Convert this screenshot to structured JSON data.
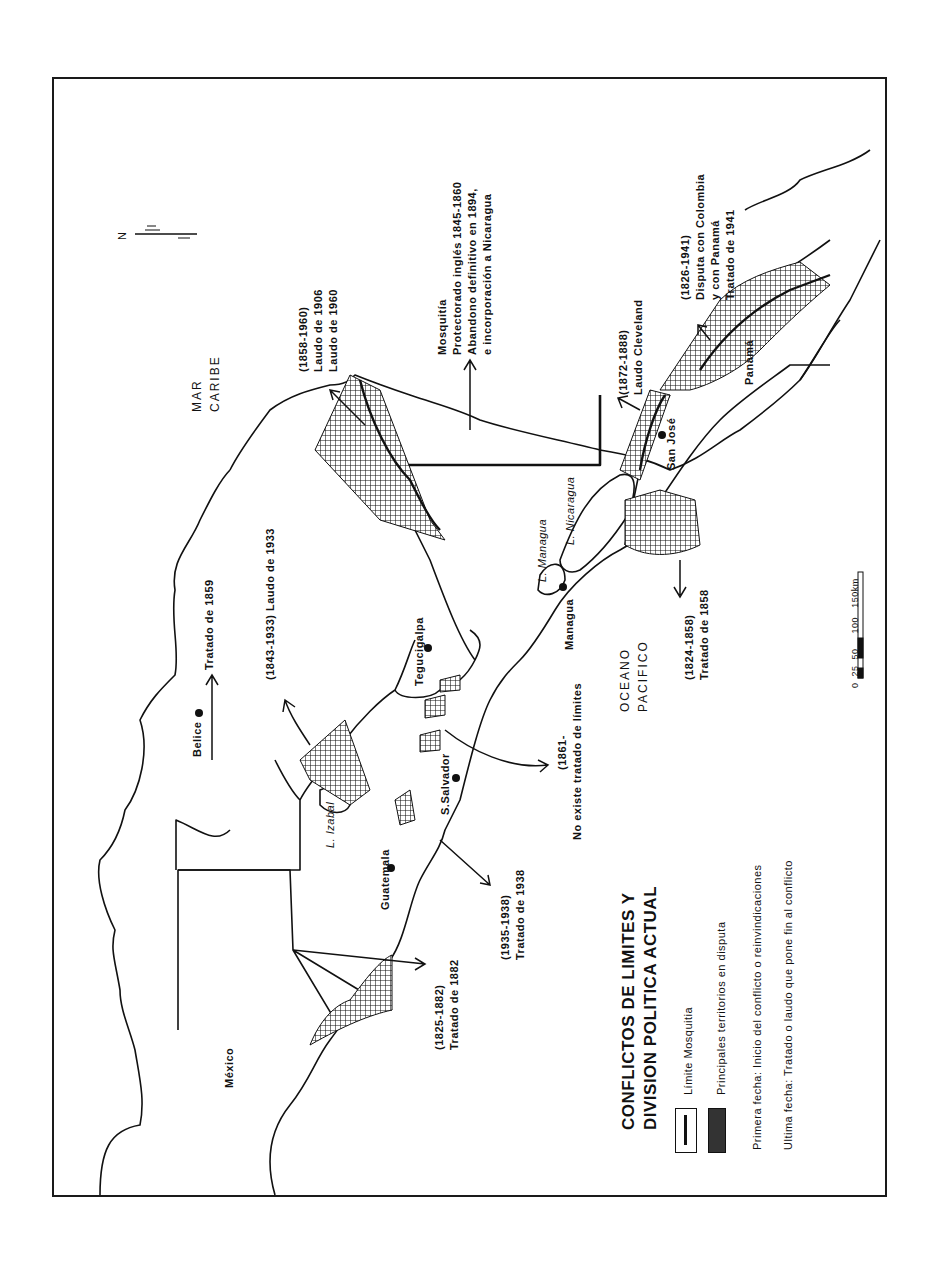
{
  "map": {
    "title_line1": "CONFLICTOS DE LIMITES  Y",
    "title_line2": "DIVISION POLITICA ACTUAL",
    "orientation": "rotated 90 degrees counter-clockwise",
    "north_arrow": {
      "label": "N",
      "icon": "north-arrow-icon"
    },
    "seas": {
      "caribbean": [
        "MAR",
        "CARIBE"
      ],
      "pacific": [
        "OCEANO",
        "PACIFICO"
      ]
    },
    "countries": [
      "México",
      "Belice",
      "Guatemala",
      "Panamá"
    ],
    "capitals": [
      "Belice",
      "Guatemala",
      "S.Salvador",
      "Tegucigalpa",
      "Managua",
      "San José"
    ],
    "lakes": [
      "L. Izabal",
      "L. Managua",
      "L. Nicaragua"
    ],
    "conflicts": [
      {
        "id": "mexico-guatemala",
        "period": "(1825-1882)",
        "resolution": "Tratado de 1882"
      },
      {
        "id": "belice",
        "period": "",
        "resolution": "Tratado de 1859"
      },
      {
        "id": "guatemala-honduras",
        "period": "(1843-1933)",
        "resolution": "Laudo de 1933"
      },
      {
        "id": "guatemala-elsalvador",
        "period": "(1935-1938)",
        "resolution": "Tratado de 1938"
      },
      {
        "id": "elsalvador-honduras",
        "period": "(1861-",
        "resolution": "No existe tratado de límites"
      },
      {
        "id": "honduras-nicaragua",
        "period": "(1858-1960)",
        "resolution": "Laudo de 1906",
        "resolution2": "Laudo de 1960"
      },
      {
        "id": "mosquitia",
        "period": "Mosquitía",
        "resolution": "Protectorado inglés 1845-1860",
        "resolution2": "Abandono definitivo en 1894,",
        "resolution3": "e incorporación a Nicaragua"
      },
      {
        "id": "nicaragua-costarica-guanacaste",
        "period": "(1824-1858)",
        "resolution": "Tratado de 1858"
      },
      {
        "id": "nicaragua-costarica-river",
        "period": "(1872-1888)",
        "resolution": "Laudo Cleveland"
      },
      {
        "id": "costarica-panama",
        "period": "(1826-1941)",
        "resolution": "Disputa con Colombia",
        "resolution2": "y con Panamá",
        "resolution3": "Tratado de 1941"
      }
    ],
    "scale_bar": {
      "ticks": [
        "0",
        "25",
        "50",
        "100",
        "150km"
      ]
    },
    "legend": {
      "items": [
        {
          "swatch": "boundary-line",
          "label": "Límite Mosquitia"
        },
        {
          "swatch": "crosshatch",
          "label": "Principales territorios en disputa"
        }
      ],
      "note1": "Primera fecha: Inicio del conflicto o reinvindicaciones",
      "note2": "Ultima fecha: Tratado o laudo que pone fin al conflicto"
    },
    "colors": {
      "ink": "#111111",
      "paper": "#ffffff"
    }
  }
}
